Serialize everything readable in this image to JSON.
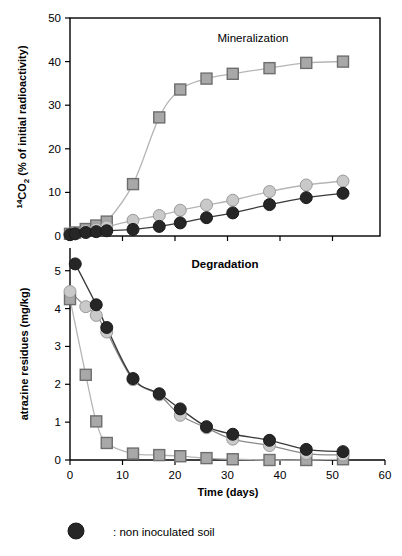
{
  "figure": {
    "background_color": "#ffffff",
    "width": 402,
    "height": 556
  },
  "colors": {
    "dark_marker": "#262626",
    "light_marker": "#c9c9c9",
    "square_fill": "#a8a8a8",
    "square_edge": "#6e6e6e",
    "dark_line": "#3a3a3a",
    "light_line": "#b5b5b5",
    "axis": "#000000",
    "text": "#000000"
  },
  "legend": {
    "marker": "filled-circle",
    "marker_color": "#262626",
    "label": ": non inoculated soil"
  },
  "axis_labels": {
    "x_title": "Time (days)",
    "y_title_top_main": "CO",
    "y_title_top_superscript": "14",
    "y_title_top_subscript": "2",
    "y_title_top_rest": " (% of initial radioactivity)",
    "y_title_top_full": "14CO2 (% of initial radioactivity)",
    "y_title_bottom": "atrazine residues (mg/kg)"
  },
  "chart_data": [
    {
      "type": "scatter",
      "panel": "top",
      "title": "Mineralization",
      "title_weight": "regular",
      "xlabel": "",
      "ylabel": "14CO2 (% of initial radioactivity)",
      "xlim": [
        0,
        60
      ],
      "ylim": [
        0,
        50
      ],
      "xticks": [
        0,
        10,
        20,
        30,
        40,
        50,
        60
      ],
      "xtick_labels": [
        "0",
        "10",
        "20",
        "30",
        "40",
        "50",
        "60"
      ],
      "yticks": [
        0,
        10,
        20,
        30,
        40,
        50
      ],
      "ytick_labels": [
        "0",
        "10",
        "20",
        "30",
        "40",
        "50"
      ],
      "grid": false,
      "legend_position": "none",
      "series": [
        {
          "name": "inoculated soil (squares)",
          "marker": "square",
          "marker_fill": "#a8a8a8",
          "marker_edge": "#6e6e6e",
          "line_color": "#b5b5b5",
          "x": [
            0,
            1,
            3,
            5,
            7,
            12,
            17,
            21,
            26,
            31,
            38,
            45,
            52
          ],
          "y": [
            0.5,
            0.8,
            1.6,
            2.4,
            3.3,
            11.9,
            27.2,
            33.6,
            36.1,
            37.2,
            38.5,
            39.7,
            40.0
          ]
        },
        {
          "name": "light circles series",
          "marker": "circle",
          "marker_fill": "#c9c9c9",
          "marker_edge": "#9a9a9a",
          "line_color": "#b5b5b5",
          "x": [
            0,
            1,
            3,
            5,
            7,
            12,
            17,
            21,
            26,
            31,
            38,
            45,
            52
          ],
          "y": [
            0.4,
            0.7,
            1.2,
            1.6,
            2.1,
            3.6,
            4.7,
            5.9,
            7.1,
            8.2,
            10.2,
            11.7,
            12.6
          ]
        },
        {
          "name": "non inoculated soil (dark circles)",
          "marker": "circle",
          "marker_fill": "#262626",
          "marker_edge": "#1a1a1a",
          "line_color": "#3a3a3a",
          "x": [
            0,
            1,
            3,
            5,
            7,
            12,
            17,
            21,
            26,
            31,
            38,
            45,
            52
          ],
          "y": [
            0.3,
            0.5,
            0.8,
            1.0,
            1.2,
            1.5,
            2.2,
            3.0,
            4.2,
            5.3,
            7.2,
            8.8,
            9.8
          ]
        }
      ]
    },
    {
      "type": "scatter",
      "panel": "bottom",
      "title": "Degradation",
      "title_weight": "bold",
      "xlabel": "Time (days)",
      "ylabel": "atrazine residues (mg/kg)",
      "xlim": [
        0,
        60
      ],
      "ylim": [
        0,
        5.6
      ],
      "xticks": [
        0,
        10,
        20,
        30,
        40,
        50,
        60
      ],
      "xtick_labels": [
        "0",
        "10",
        "20",
        "30",
        "40",
        "50",
        "60"
      ],
      "yticks": [
        0,
        1,
        2,
        3,
        4,
        5
      ],
      "ytick_labels": [
        "0",
        "1",
        "2",
        "3",
        "4",
        "5"
      ],
      "grid": false,
      "legend_position": "none",
      "series": [
        {
          "name": "inoculated soil (squares)",
          "marker": "square",
          "marker_fill": "#a8a8a8",
          "marker_edge": "#6e6e6e",
          "line_color": "#b5b5b5",
          "x": [
            0,
            3,
            5,
            7,
            12,
            17,
            21,
            26,
            31,
            38,
            45,
            52
          ],
          "y": [
            4.25,
            2.25,
            1.02,
            0.45,
            0.17,
            0.13,
            0.1,
            0.05,
            0.02,
            0.0,
            0.0,
            0.02
          ]
        },
        {
          "name": "light circles series",
          "marker": "circle",
          "marker_fill": "#c9c9c9",
          "marker_edge": "#9a9a9a",
          "line_color": "#8a8a8a",
          "x": [
            0,
            3,
            5,
            7,
            12,
            17,
            21,
            26,
            31,
            38,
            45,
            52
          ],
          "y": [
            4.45,
            4.05,
            3.82,
            3.38,
            2.12,
            1.72,
            1.18,
            0.85,
            0.55,
            0.38,
            0.17,
            0.13
          ]
        },
        {
          "name": "non inoculated soil (dark circles)",
          "marker": "circle",
          "marker_fill": "#262626",
          "marker_edge": "#1a1a1a",
          "line_color": "#3a3a3a",
          "x": [
            1,
            5,
            7,
            12,
            17,
            21,
            26,
            31,
            38,
            45,
            52
          ],
          "y": [
            5.18,
            4.1,
            3.5,
            2.15,
            1.75,
            1.35,
            0.88,
            0.68,
            0.52,
            0.28,
            0.22
          ]
        }
      ]
    }
  ]
}
